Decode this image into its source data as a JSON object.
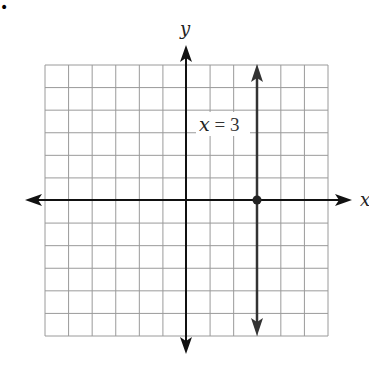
{
  "bullet": "•",
  "graph": {
    "x_axis_label": "x",
    "y_axis_label": "y",
    "equation_label_var": "x",
    "equation_label_rest": " = 3",
    "grid": {
      "xmin": -6,
      "xmax": 6,
      "ymin": -6,
      "ymax": 6,
      "step": 1
    },
    "line": {
      "type": "vertical",
      "x": 3
    },
    "point": {
      "x": 3,
      "y": 0
    },
    "colors": {
      "grid": "#9a9a9a",
      "axis": "#111111",
      "line": "#333333"
    }
  },
  "chart_data": {
    "type": "line",
    "title": "x = 3",
    "xlabel": "x",
    "ylabel": "y",
    "xlim": [
      -6,
      6
    ],
    "ylim": [
      -6,
      6
    ],
    "grid": true,
    "series": [
      {
        "name": "x = 3",
        "x": [
          3,
          3
        ],
        "y": [
          -6,
          6
        ]
      }
    ],
    "annotations": [
      {
        "text": "x = 3",
        "x": 3,
        "y": 4
      },
      {
        "point": [
          3,
          0
        ]
      }
    ]
  }
}
